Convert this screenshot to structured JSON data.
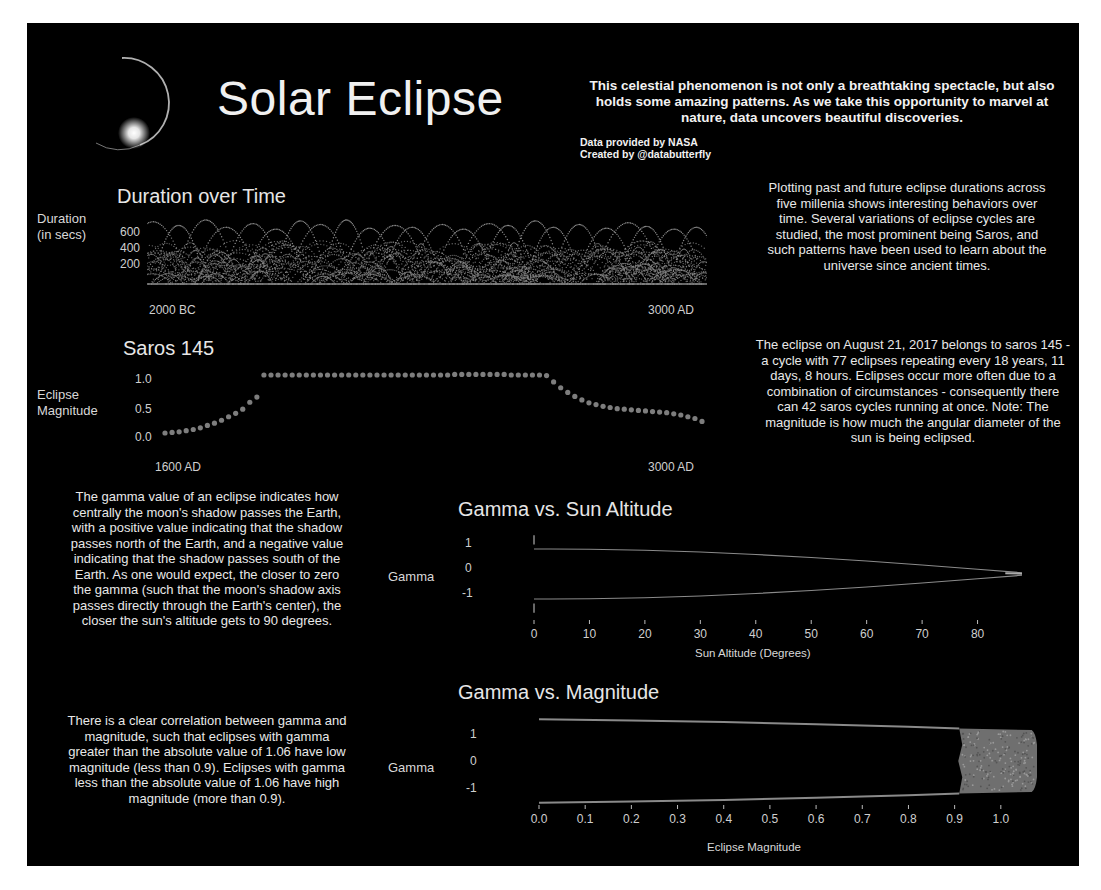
{
  "header": {
    "title": "Solar Eclipse",
    "intro": "This celestial phenomenon is not only a breathtaking spectacle, but also holds some amazing patterns. As we take this opportunity to marvel at nature, data uncovers beautiful discoveries.",
    "credit_data": "Data provided by NASA",
    "credit_author": "Created by @databutterfly",
    "logo_icon": "eclipse-diamond-ring-icon"
  },
  "paragraphs": {
    "duration": "Plotting past and future eclipse durations across five millenia shows interesting behaviors over time. Several variations of eclipse cycles are studied, the most prominent being Saros, and such patterns have been used to learn about the universe since ancient times.",
    "saros": "The eclipse on August 21, 2017 belongs to saros 145 - a cycle with 77 eclipses repeating every 18 years, 11 days, 8 hours. Eclipses occur more often due to a combination of circumstances - consequently there can 42 saros cycles running at once.  Note: The magnitude is how much the angular diameter of the sun is being eclipsed.",
    "gamma": "The gamma value of an eclipse indicates how centrally the moon's shadow passes the Earth, with a positive value indicating that the shadow passes north of the Earth, and a negative value indicating that the shadow passes south of the Earth. As one would expect, the closer to zero the gamma (such that the moon's shadow axis passes directly through the Earth's center), the closer the sun's altitude gets to 90 degrees.",
    "magnitude": "There is a clear correlation between gamma and magnitude, such that eclipses with gamma greater than the absolute value of 1.06 have low magnitude (less than 0.9). Eclipses with gamma less than the absolute value of 1.06 have high magnitude (more than 0.9)."
  },
  "colors": {
    "background": "#000000",
    "mark": "#8a8a8a",
    "text": "#e8e8e8"
  },
  "chart_data": [
    {
      "id": "duration",
      "type": "line",
      "title": "Duration over Time",
      "ylabel_line1": "Duration",
      "ylabel_line2": "(in secs)",
      "xlabel": "",
      "x_start_label": "2000 BC",
      "x_end_label": "3000 AD",
      "yticks": [
        "600",
        "400",
        "200"
      ],
      "ylim": [
        0,
        700
      ],
      "grid": false,
      "legend": "none",
      "description": "Many overlapping dotted arcs (one per saros series) of eclipse duration across 2000 BC to 3000 AD; peaks reach ~650-700 secs, dense band 0-450 secs.",
      "series_peaks": [
        680,
        640,
        700,
        620,
        660,
        600,
        690,
        650,
        700,
        610,
        640,
        620,
        650,
        600,
        660,
        640,
        690,
        620,
        650,
        610,
        670,
        630,
        600,
        620
      ]
    },
    {
      "id": "saros145",
      "type": "scatter",
      "title": "Saros 145",
      "ylabel_line1": "Eclipse",
      "ylabel_line2": "Magnitude",
      "x_start_label": "1600 AD",
      "x_end_label": "3000 AD",
      "yticks": [
        "1.0",
        "0.5",
        "0.0"
      ],
      "ylim": [
        0,
        1.1
      ],
      "grid": false,
      "count": 77,
      "values": [
        0.0,
        0.01,
        0.02,
        0.04,
        0.06,
        0.09,
        0.13,
        0.17,
        0.22,
        0.28,
        0.34,
        0.41,
        0.53,
        0.62,
        1.0,
        1.0,
        1.0,
        1.0,
        1.0,
        1.0,
        1.0,
        1.0,
        1.0,
        1.0,
        1.0,
        1.0,
        1.0,
        1.0,
        1.0,
        1.0,
        1.0,
        1.0,
        1.0,
        1.0,
        1.0,
        1.0,
        1.0,
        1.0,
        1.0,
        1.0,
        1.0,
        1.01,
        1.01,
        1.01,
        1.01,
        1.01,
        1.01,
        1.01,
        1.01,
        1.0,
        1.0,
        1.0,
        1.0,
        1.0,
        0.99,
        0.88,
        0.78,
        0.7,
        0.63,
        0.57,
        0.52,
        0.49,
        0.46,
        0.44,
        0.42,
        0.41,
        0.4,
        0.39,
        0.38,
        0.37,
        0.36,
        0.35,
        0.33,
        0.31,
        0.28,
        0.25,
        0.2
      ]
    },
    {
      "id": "gamma-altitude",
      "type": "scatter",
      "title": "Gamma vs. Sun Altitude",
      "xlabel": "Sun Altitude (Degrees)",
      "ylabel": "Gamma",
      "xticks": [
        "0",
        "10",
        "20",
        "30",
        "40",
        "50",
        "60",
        "70",
        "80",
        "90"
      ],
      "yticks": [
        "1",
        "0",
        "-1"
      ],
      "xlim": [
        0,
        90
      ],
      "ylim": [
        -1.6,
        1.6
      ],
      "grid": false,
      "upper_branch": [
        [
          0,
          1.55
        ],
        [
          0,
          1.0
        ],
        [
          3,
          1.0
        ],
        [
          10,
          0.99
        ],
        [
          20,
          0.95
        ],
        [
          30,
          0.88
        ],
        [
          40,
          0.78
        ],
        [
          50,
          0.66
        ],
        [
          60,
          0.52
        ],
        [
          70,
          0.36
        ],
        [
          80,
          0.19
        ],
        [
          88,
          0.05
        ],
        [
          90,
          0.0
        ]
      ],
      "lower_branch": [
        [
          0,
          -1.55
        ],
        [
          0,
          -1.0
        ],
        [
          3,
          -1.0
        ],
        [
          10,
          -0.99
        ],
        [
          20,
          -0.95
        ],
        [
          30,
          -0.88
        ],
        [
          40,
          -0.78
        ],
        [
          50,
          -0.66
        ],
        [
          60,
          -0.52
        ],
        [
          70,
          -0.36
        ],
        [
          80,
          -0.19
        ],
        [
          88,
          -0.05
        ],
        [
          90,
          0.0
        ]
      ]
    },
    {
      "id": "gamma-magnitude",
      "type": "scatter",
      "title": "Gamma vs. Magnitude",
      "xlabel": "Eclipse Magnitude",
      "ylabel": "Gamma",
      "xticks": [
        "0.0",
        "0.1",
        "0.2",
        "0.3",
        "0.4",
        "0.5",
        "0.6",
        "0.7",
        "0.8",
        "0.9",
        "1.0",
        "1.1"
      ],
      "yticks": [
        "1",
        "0",
        "-1"
      ],
      "xlim": [
        0,
        1.1
      ],
      "ylim": [
        -1.6,
        1.6
      ],
      "grid": false,
      "upper_branch": [
        [
          0.0,
          1.55
        ],
        [
          0.2,
          1.5
        ],
        [
          0.4,
          1.44
        ],
        [
          0.6,
          1.36
        ],
        [
          0.8,
          1.27
        ],
        [
          0.91,
          1.2
        ]
      ],
      "lower_branch": [
        [
          0.0,
          -1.55
        ],
        [
          0.2,
          -1.5
        ],
        [
          0.4,
          -1.44
        ],
        [
          0.6,
          -1.36
        ],
        [
          0.8,
          -1.27
        ],
        [
          0.91,
          -1.2
        ]
      ],
      "dense_region": {
        "x_range": [
          0.91,
          1.08
        ],
        "y_range": [
          -1.06,
          1.06
        ]
      }
    }
  ]
}
